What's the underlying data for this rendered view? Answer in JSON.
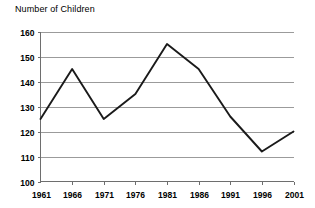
{
  "chart_data": {
    "type": "line",
    "title": "Number of Children",
    "xlabel": "",
    "ylabel": "",
    "categories": [
      "1961",
      "1966",
      "1971",
      "1976",
      "1981",
      "1986",
      "1991",
      "1996",
      "2001"
    ],
    "x": [
      1961,
      1966,
      1971,
      1976,
      1981,
      1986,
      1991,
      1996,
      2001
    ],
    "values": [
      125,
      145,
      125,
      135,
      155,
      145,
      126,
      112,
      120
    ],
    "series": [
      {
        "name": "Number of Children",
        "values": [
          125,
          145,
          125,
          135,
          155,
          145,
          126,
          112,
          120
        ]
      }
    ],
    "ylim": [
      100,
      160
    ],
    "ytick_labels": [
      "100",
      "110",
      "120",
      "130",
      "140",
      "150",
      "160"
    ],
    "yticks": [
      100,
      110,
      120,
      130,
      140,
      150,
      160
    ],
    "xtick_labels": [
      "1961",
      "1966",
      "1971",
      "1976",
      "1981",
      "1986",
      "1991",
      "1996",
      "2001"
    ],
    "grid": true,
    "grid_axis": "y",
    "legend": false,
    "legend_position": "none",
    "line_color": "#1a1a1a",
    "grid_color": "#9b9b9b",
    "axis_color": "#6e6e6e",
    "background_color": "#ffffff",
    "annotations": []
  }
}
